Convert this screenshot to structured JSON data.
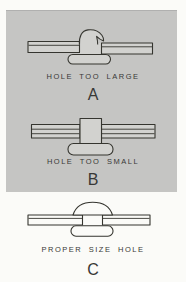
{
  "figure": {
    "panels": [
      {
        "caption": "HOLE TOO LARGE",
        "label": "A"
      },
      {
        "caption": "HOLE TOO SMALL",
        "label": "B"
      },
      {
        "caption": "PROPER SIZE HOLE",
        "label": "C"
      }
    ],
    "colors": {
      "page_bg": "#fbfbf8",
      "panel_bg": "#c5c5c3",
      "line": "#35352f",
      "shape_fill_gray": "#d2d2cf",
      "shape_fill_white": "#fbfbf8",
      "text": "#383836"
    }
  }
}
